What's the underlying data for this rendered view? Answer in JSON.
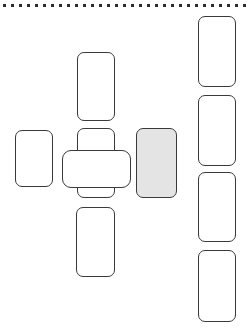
{
  "canvas": {
    "width": 252,
    "height": 336,
    "background": "#ffffff",
    "stroke_color": "#3a3a3a",
    "fill_empty": "#ffffff",
    "fill_highlight": "#e4e4e4"
  },
  "dot_rail": {
    "name": "top-dotted-rule",
    "dot_count": 31,
    "dot_size": 3,
    "dot_spacing": 8,
    "start_x": 3,
    "y": 4,
    "color": "#2e2e2e"
  },
  "shapes": [
    {
      "id": "center-top-card",
      "label": "top",
      "x": 77,
      "y": 52,
      "w": 38,
      "h": 69,
      "fill": "#ffffff",
      "radius": 7,
      "layer": "front"
    },
    {
      "id": "center-vertical-card",
      "label": "center-vertical",
      "x": 77,
      "y": 128,
      "w": 38,
      "h": 70,
      "fill": "#ffffff",
      "radius": 7,
      "layer": "back"
    },
    {
      "id": "center-horizontal-card",
      "label": "center-horizontal",
      "x": 62,
      "y": 150,
      "w": 69,
      "h": 38,
      "fill": "#ffffff",
      "radius": 9,
      "layer": "front"
    },
    {
      "id": "left-card",
      "label": "left",
      "x": 15,
      "y": 130,
      "w": 38,
      "h": 57,
      "fill": "#ffffff",
      "radius": 7,
      "layer": "front"
    },
    {
      "id": "right-highlight-card",
      "label": "right-highlight",
      "x": 136,
      "y": 128,
      "w": 41,
      "h": 70,
      "fill": "#e4e4e4",
      "radius": 7,
      "layer": "front"
    },
    {
      "id": "center-bottom-card",
      "label": "bottom",
      "x": 76,
      "y": 207,
      "w": 39,
      "h": 70,
      "fill": "#ffffff",
      "radius": 7,
      "layer": "front"
    },
    {
      "id": "column-card-1",
      "label": "column-1",
      "x": 198,
      "y": 16,
      "w": 38,
      "h": 71,
      "fill": "#ffffff",
      "radius": 7,
      "layer": "front"
    },
    {
      "id": "column-card-2",
      "label": "column-2",
      "x": 198,
      "y": 95,
      "w": 38,
      "h": 71,
      "fill": "#ffffff",
      "radius": 7,
      "layer": "front"
    },
    {
      "id": "column-card-3",
      "label": "column-3",
      "x": 198,
      "y": 172,
      "w": 38,
      "h": 70,
      "fill": "#ffffff",
      "radius": 7,
      "layer": "front"
    },
    {
      "id": "column-card-4",
      "label": "column-4",
      "x": 198,
      "y": 250,
      "w": 38,
      "h": 72,
      "fill": "#ffffff",
      "radius": 7,
      "layer": "front"
    }
  ]
}
